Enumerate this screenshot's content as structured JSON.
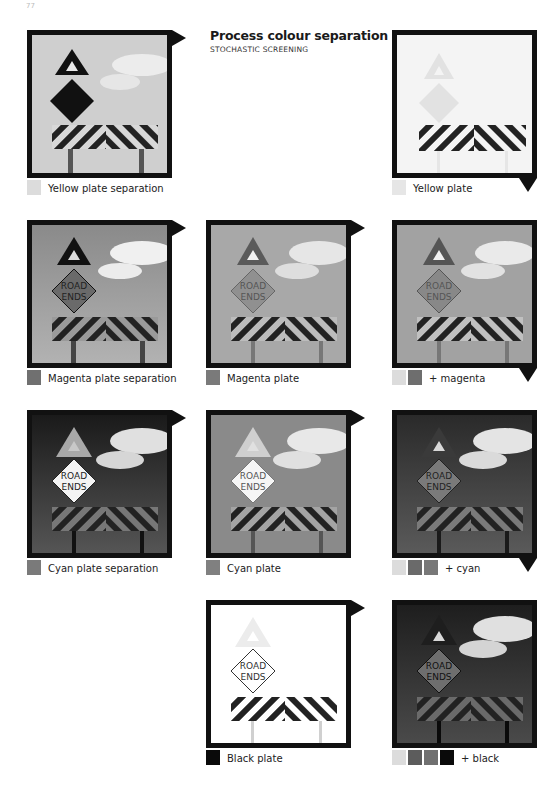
{
  "page_number": "77",
  "header": {
    "title": "Process colour separation",
    "subtitle": "STOCHASTIC SCREENING"
  },
  "sign_text": {
    "line1": "ROAD",
    "line2": "ENDS"
  },
  "colors": {
    "frame": "#111111",
    "yellow_swatch": "#dcdcdc",
    "magenta_swatch": "#6e6e6e",
    "cyan_swatch": "#777777",
    "black_swatch": "#0a0a0a"
  },
  "panels": [
    {
      "id": "yellow-separation",
      "caption": "Yellow plate separation",
      "swatches": [
        "#dcdcdc"
      ],
      "marker": "flag-right"
    },
    {
      "id": "yellow-plate",
      "caption": "Yellow plate",
      "swatches": [
        "#e6e6e6"
      ],
      "marker": "flag-down"
    },
    {
      "id": "magenta-separation",
      "caption": "Magenta plate separation",
      "swatches": [
        "#707070"
      ],
      "marker": "flag-right"
    },
    {
      "id": "magenta-plate",
      "caption": "Magenta plate",
      "swatches": [
        "#7a7a7a"
      ],
      "marker": "flag-right"
    },
    {
      "id": "plus-magenta",
      "caption": "+ magenta",
      "swatches": [
        "#dcdcdc",
        "#6e6e6e"
      ],
      "marker": "flag-down"
    },
    {
      "id": "cyan-separation",
      "caption": "Cyan plate separation",
      "swatches": [
        "#7a7a7a"
      ],
      "marker": "flag-right"
    },
    {
      "id": "cyan-plate",
      "caption": "Cyan plate",
      "swatches": [
        "#808080"
      ],
      "marker": "flag-right"
    },
    {
      "id": "plus-cyan",
      "caption": "+ cyan",
      "swatches": [
        "#dcdcdc",
        "#6a6a6a",
        "#787878"
      ],
      "marker": "flag-down"
    },
    {
      "id": "black-plate",
      "caption": "Black plate",
      "swatches": [
        "#0a0a0a"
      ],
      "marker": "flag-right"
    },
    {
      "id": "plus-black",
      "caption": "+ black",
      "swatches": [
        "#dcdcdc",
        "#5c5c5c",
        "#707070",
        "#0a0a0a"
      ],
      "marker": "none"
    }
  ]
}
